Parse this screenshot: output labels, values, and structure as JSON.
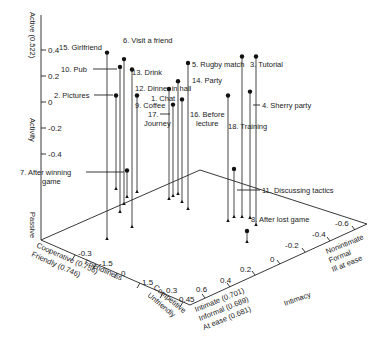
{
  "chart_data": {
    "type": "scatter",
    "subtype": "3d-stem",
    "title": "",
    "axes": {
      "activity": {
        "label": "Activity",
        "pos_label": "Active (0.522)",
        "neg_label": "Passive",
        "ticks": [
          "0.4",
          "0.2",
          "0",
          "-0.2",
          "-0.4"
        ],
        "range": [
          -0.5,
          0.5
        ]
      },
      "friendliness": {
        "label": "Friendliness",
        "pos_label_lines": [
          "Cooperative (0.756)",
          "Friendly (0.746)"
        ],
        "neg_label_lines": [
          "Competitive",
          "Unfriendly"
        ],
        "ticks": [
          "-0.3",
          "-1.5",
          "0",
          "1.5",
          "0.3",
          "0.45"
        ]
      },
      "intimacy": {
        "label": "Intimacy",
        "pos_label_lines": [
          "Intimate (0.701)",
          "Informal (0.689)",
          "At ease (0.681)"
        ],
        "neg_label_lines": [
          "Nonintimate",
          "Formal",
          "Ill at ease"
        ],
        "ticks": [
          "0.6",
          "0.4",
          "0.2",
          "0",
          "-0.2",
          "-0.4",
          "-0.6"
        ]
      }
    },
    "points": [
      {
        "id": 15,
        "label": "15. Girlfriend",
        "activity": 0.38
      },
      {
        "id": 6,
        "label": "6. Visit a friend",
        "activity": 0.33
      },
      {
        "id": 10,
        "label": "10. Pub",
        "activity": 0.27
      },
      {
        "id": 13,
        "label": "13. Drink",
        "activity": 0.25
      },
      {
        "id": 2,
        "label": "2. Pictures",
        "activity": 0.05
      },
      {
        "id": 5,
        "label": "5. Rugby match",
        "activity": 0.35
      },
      {
        "id": 3,
        "label": "3. Tutorial",
        "activity": 0.35
      },
      {
        "id": 14,
        "label": "14. Party",
        "activity": 0.3
      },
      {
        "id": 12,
        "label": "12. Dinner in hall",
        "activity": 0.16
      },
      {
        "id": 1,
        "label": "1. Chat",
        "activity": 0.1
      },
      {
        "id": 9,
        "label": "9. Coffee",
        "activity": 0.05
      },
      {
        "id": 17,
        "label": "17. Journey",
        "activity": -0.02
      },
      {
        "id": 16,
        "label": "16. Before lecture",
        "activity": 0.02
      },
      {
        "id": 18,
        "label": "18. Training",
        "activity": 0.05
      },
      {
        "id": 4,
        "label": "4. Sherry party",
        "activity": 0.08
      },
      {
        "id": 7,
        "label": "7. After winning game",
        "activity": -0.45
      },
      {
        "id": 11,
        "label": "11. Discussing tactics",
        "activity": -0.53
      },
      {
        "id": 8,
        "label": "8. After lost game",
        "activity": -0.8
      }
    ]
  }
}
